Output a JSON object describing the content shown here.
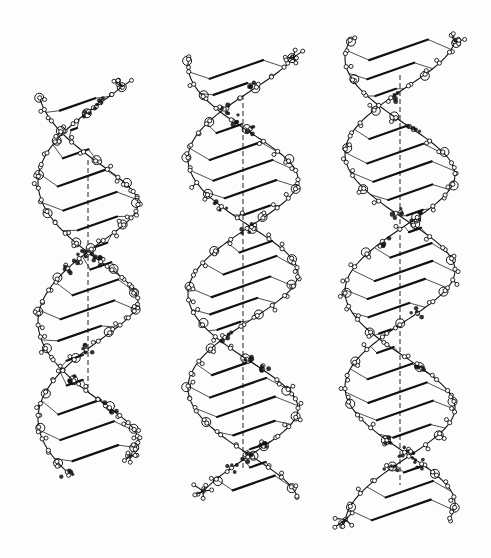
{
  "figure": {
    "background": "#fdfdfd",
    "ink": "#111111",
    "helices": [
      {
        "id": "left",
        "axis_x": 88,
        "top": 95,
        "bottom": 462,
        "radius": 50,
        "turns": 1.55,
        "phase": 2.4,
        "tilt": 0.55,
        "base_pairs": 16,
        "axis_top": 160,
        "axis_bottom": 388
      },
      {
        "id": "middle",
        "axis_x": 243,
        "top": 60,
        "bottom": 495,
        "radius": 55,
        "turns": 1.9,
        "phase": 2.0,
        "tilt": 0.28,
        "base_pairs": 22,
        "axis_top": 95,
        "axis_bottom": 470
      },
      {
        "id": "right",
        "axis_x": 400,
        "top": 42,
        "bottom": 520,
        "radius": 55,
        "turns": 2.05,
        "phase": 1.7,
        "tilt": 0.2,
        "base_pairs": 24,
        "axis_top": 75,
        "axis_bottom": 485
      }
    ]
  }
}
